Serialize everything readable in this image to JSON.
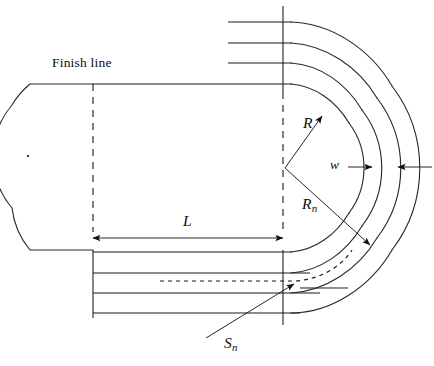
{
  "diagram": {
    "labels": {
      "finish_line": "Finish line",
      "radius_inner": "R",
      "lane_width": "w",
      "radius_lane_n_base": "R",
      "radius_lane_n_sub": "n",
      "straight_length": "L",
      "stagger_base": "S",
      "stagger_sub": "n"
    },
    "colors": {
      "ink": "#1a1a1a",
      "curve": "#2a2a2a",
      "background": "#ffffff"
    },
    "geometry": {
      "lane_count": 4,
      "center_right_x": 285,
      "center_right_y": 168,
      "center_left_x": 28,
      "center_left_y": 156,
      "inner_radius_px": 75,
      "lane_width_px": 20,
      "straight_left_x": 93,
      "straight_right_x": 283,
      "top_lane_y": [
        22,
        43,
        63,
        84
      ],
      "bottom_lane_y": [
        252,
        273,
        293,
        313
      ],
      "dashed_stagger_y": 281
    }
  }
}
